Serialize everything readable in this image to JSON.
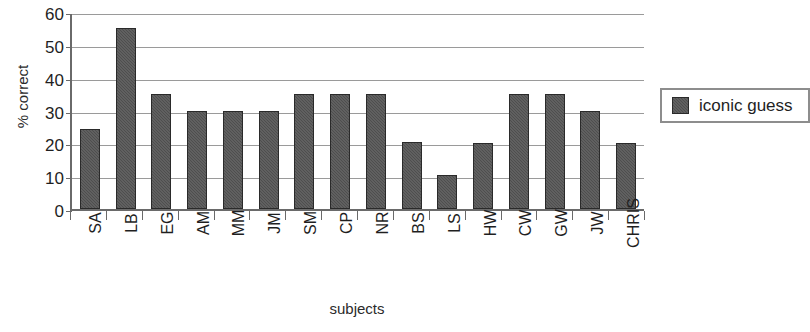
{
  "chart_data": {
    "type": "bar",
    "title": "",
    "xlabel": "subjects",
    "ylabel": "% correct",
    "ylim": [
      0,
      60
    ],
    "yticks": [
      60,
      50,
      40,
      30,
      20,
      10,
      0
    ],
    "grid": true,
    "legend_position": "right",
    "categories": [
      "SA",
      "LB",
      "EG",
      "AM",
      "MM",
      "JM",
      "SM",
      "CP",
      "NR",
      "BS",
      "LS",
      "HW",
      "CW",
      "GW",
      "JW",
      "CHRIS"
    ],
    "series": [
      {
        "name": "iconic guess",
        "color": "#4e4e4e",
        "values": [
          24.5,
          55,
          35,
          30,
          30,
          30,
          35,
          35,
          35,
          20.5,
          10.5,
          20,
          35,
          35,
          30,
          20
        ]
      }
    ]
  },
  "legend": {
    "entries": [
      {
        "label": "iconic guess",
        "swatch_name": "legend-swatch-iconic-guess"
      }
    ]
  }
}
